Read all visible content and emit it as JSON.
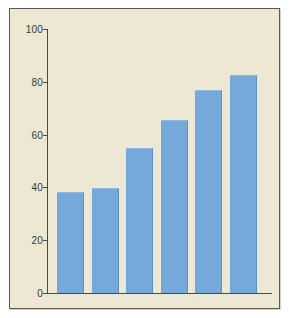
{
  "figure": {
    "background_color": "#ece8d4",
    "border_color": "#5b5c50",
    "bar_color": "#76a9db",
    "label_color": "#1d2a4a",
    "axis_color": "#4a4b42"
  },
  "chart_data": {
    "type": "bar",
    "title": "",
    "subtitle": "",
    "xlabel": "",
    "ylabel": "",
    "ylim": [
      0,
      100
    ],
    "yticks": [
      0,
      20,
      40,
      60,
      80,
      100
    ],
    "ytick_labels": [
      "0",
      "20",
      "40",
      "60",
      "80",
      "100"
    ],
    "grid": false,
    "legend": false,
    "legend_position": "none",
    "orientation": "vertical",
    "categories": [
      "Less than 9th grade",
      "9th–12th, no diploma",
      "High school graduate",
      "Some college or associate degree",
      "Bachelor's degree",
      "Advanced degree"
    ],
    "values": [
      38.1,
      39.9,
      54.9,
      65.4,
      77,
      82.7
    ],
    "value_labels": [
      "38.1%",
      "39.9%",
      "54.9%",
      "65.4%",
      "77%",
      "82.7%"
    ],
    "series": [
      {
        "name": "",
        "values": [
          38.1,
          39.9,
          54.9,
          65.4,
          77,
          82.7
        ]
      }
    ]
  }
}
